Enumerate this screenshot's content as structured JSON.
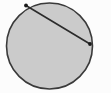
{
  "figure": {
    "canvas": {
      "width": 111,
      "height": 93
    },
    "background_color": "#fcfcfc",
    "circle": {
      "label": "circle",
      "center_x": 49.5,
      "center_y": 46,
      "radius": 43,
      "fill_color": "#cbcbcb",
      "stroke_color": "#3a3a3a",
      "stroke_width": 1.6
    },
    "chord": {
      "label": "chord",
      "x1": 26,
      "y1": 5.5,
      "x2": 90,
      "y2": 44,
      "stroke_color": "#2b2b2b",
      "stroke_width": 1.6
    },
    "endpoints": [
      {
        "label": "chord-endpoint-upper-left",
        "cx": 26,
        "cy": 5.5,
        "radius": 1.9,
        "color": "#1a1a1a"
      },
      {
        "label": "chord-endpoint-right",
        "cx": 90,
        "cy": 44,
        "radius": 1.9,
        "color": "#1a1a1a"
      }
    ]
  },
  "chart_data": {
    "type": "scatter",
    "xlabel": "",
    "ylabel": "",
    "xlim": [
      0,
      111
    ],
    "ylim": [
      0,
      93
    ],
    "grid": false,
    "legend": "none",
    "shapes": [
      {
        "kind": "circle",
        "name": "circle",
        "center": [
          49.5,
          46
        ],
        "radius": 43,
        "fill": "#cbcbcb",
        "stroke": "#3a3a3a"
      },
      {
        "kind": "line",
        "name": "chord",
        "points": [
          [
            26,
            5.5
          ],
          [
            90,
            44
          ]
        ],
        "stroke": "#2b2b2b"
      }
    ],
    "points": [
      {
        "name": "chord-endpoint-upper-left",
        "x": 26,
        "y": 5.5
      },
      {
        "name": "chord-endpoint-right",
        "x": 90,
        "y": 44
      }
    ],
    "annotations": []
  }
}
